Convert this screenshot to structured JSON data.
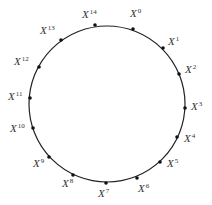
{
  "diagram": {
    "type": "cyclic-ring",
    "circle": {
      "cx": 107,
      "cy": 104,
      "r": 78,
      "stroke": "#222222"
    },
    "base_symbol": "X",
    "nodes": [
      {
        "exp": "0",
        "dot": [
          133,
          29
        ],
        "label": [
          130,
          8
        ]
      },
      {
        "exp": "1",
        "dot": [
          163,
          48
        ],
        "label": [
          168,
          36
        ]
      },
      {
        "exp": "2",
        "dot": [
          179,
          74
        ],
        "label": [
          185,
          64
        ]
      },
      {
        "exp": "3",
        "dot": [
          185,
          108
        ],
        "label": [
          191,
          101
        ]
      },
      {
        "exp": "4",
        "dot": [
          177,
          137
        ],
        "label": [
          184,
          133
        ]
      },
      {
        "exp": "5",
        "dot": [
          160,
          162
        ],
        "label": [
          167,
          158
        ]
      },
      {
        "exp": "6",
        "dot": [
          137,
          178
        ],
        "label": [
          138,
          183
        ]
      },
      {
        "exp": "7",
        "dot": [
          106,
          183
        ],
        "label": [
          98,
          188
        ]
      },
      {
        "exp": "8",
        "dot": [
          73,
          175
        ],
        "label": [
          62,
          178
        ]
      },
      {
        "exp": "9",
        "dot": [
          49,
          157
        ],
        "label": [
          33,
          158
        ]
      },
      {
        "exp": "10",
        "dot": [
          33,
          128
        ],
        "label": [
          10,
          123
        ]
      },
      {
        "exp": "11",
        "dot": [
          30,
          98
        ],
        "label": [
          8,
          91
        ]
      },
      {
        "exp": "12",
        "dot": [
          39,
          67
        ],
        "label": [
          14,
          56
        ]
      },
      {
        "exp": "13",
        "dot": [
          61,
          40
        ],
        "label": [
          40,
          25
        ]
      },
      {
        "exp": "14",
        "dot": [
          95,
          25
        ],
        "label": [
          82,
          9
        ]
      }
    ]
  }
}
